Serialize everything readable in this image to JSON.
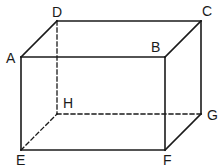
{
  "diagram": {
    "vertices": {
      "A": "A",
      "B": "B",
      "C": "C",
      "D": "D",
      "E": "E",
      "F": "F",
      "G": "G",
      "H": "H"
    },
    "visible_edges": [
      "AB",
      "BC",
      "CD",
      "DA",
      "AE",
      "BF",
      "CG",
      "EF",
      "FG"
    ],
    "hidden_edges": [
      "DH",
      "EH",
      "HG"
    ],
    "line_color": "#1a1a1a"
  }
}
